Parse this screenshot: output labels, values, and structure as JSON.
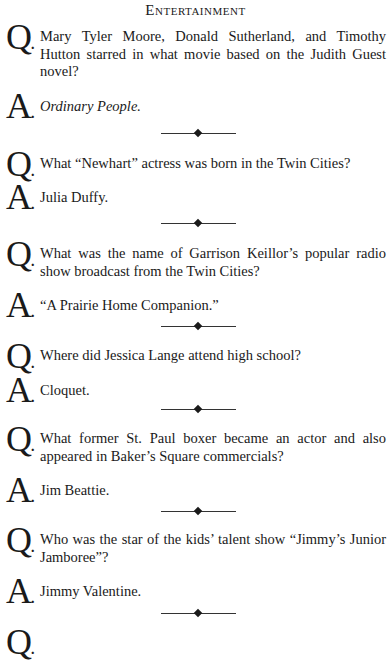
{
  "header": {
    "title": "Entertainment"
  },
  "items": [
    {
      "q_letter": "Q",
      "a_letter": "A",
      "question": "Mary Tyler Moore, Donald Sutherland, and Timothy Hutton starred in what movie based on the Judith Guest novel?",
      "answer": "Ordinary People.",
      "answer_italic": true
    },
    {
      "q_letter": "Q",
      "a_letter": "A",
      "question": "What “Newhart” actress was born in the Twin Cities?",
      "answer": "Julia Duffy."
    },
    {
      "q_letter": "Q",
      "a_letter": "A",
      "question": "What was the name of Garrison Keillor’s popular radio show broadcast from the Twin Cities?",
      "answer": "“A Prairie Home Companion.”"
    },
    {
      "q_letter": "Q",
      "a_letter": "A",
      "question": "Where did Jessica Lange attend high school?",
      "answer": "Cloquet."
    },
    {
      "q_letter": "Q",
      "a_letter": "A",
      "question": "What former St. Paul boxer became an actor and also appeared in Baker’s Square commercials?",
      "answer": "Jim Beattie."
    },
    {
      "q_letter": "Q",
      "a_letter": "A",
      "question": "Who was the star of the kids’ talent show “Jimmy’s Junior Jamboree”?",
      "answer": "Jimmy Valentine."
    },
    {
      "q_letter": "Q",
      "question": ""
    }
  ],
  "dot": "."
}
